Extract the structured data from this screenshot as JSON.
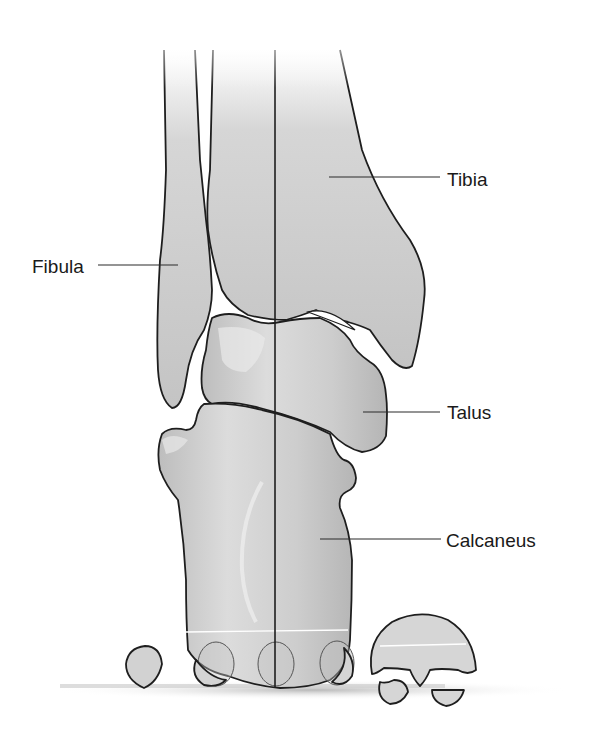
{
  "figure": {
    "view": "posterior ankle / hindfoot alignment",
    "labels": [
      {
        "id": "tibia",
        "text": "Tibia"
      },
      {
        "id": "fibula",
        "text": "Fibula"
      },
      {
        "id": "talus",
        "text": "Talus"
      },
      {
        "id": "calcaneus",
        "text": "Calcaneus"
      }
    ]
  },
  "colors": {
    "background": "#ffffff",
    "bone_fill": "#c9c9c9",
    "bone_light": "#e6e6e6",
    "outline": "#1e1e1e",
    "text": "#1a1a1a",
    "ground_shadow": "#bdbdbd"
  }
}
